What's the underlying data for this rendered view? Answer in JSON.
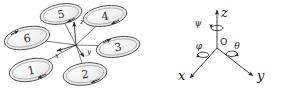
{
  "figure": {
    "background": "#ffffff",
    "stroke": "#3a3a3a",
    "rotor_fill": "#f0f0f0"
  },
  "hexacopter": {
    "name": "hexacopter-schematic",
    "rotors": [
      {
        "id": "1",
        "label": "1",
        "cx": 31,
        "cy": 70,
        "rx": 22,
        "ry": 11,
        "rot": -12,
        "spin": "cw"
      },
      {
        "id": "2",
        "label": "2",
        "cx": 85,
        "cy": 74,
        "rx": 22,
        "ry": 11,
        "rot": -8,
        "spin": "ccw"
      },
      {
        "id": "3",
        "label": "3",
        "cx": 118,
        "cy": 47,
        "rx": 22,
        "ry": 10,
        "rot": -10,
        "spin": "cw"
      },
      {
        "id": "4",
        "label": "4",
        "cx": 105,
        "cy": 16,
        "rx": 22,
        "ry": 10,
        "rot": -10,
        "spin": "ccw"
      },
      {
        "id": "5",
        "label": "5",
        "cx": 61,
        "cy": 14,
        "rx": 21,
        "ry": 10,
        "rot": -10,
        "spin": "cw"
      },
      {
        "id": "6",
        "label": "6",
        "cx": 27,
        "cy": 38,
        "rx": 23,
        "ry": 11,
        "rot": -12,
        "spin": "ccw"
      }
    ],
    "hub": {
      "x": 76,
      "y": 45
    },
    "body_axes": [
      {
        "axis": "z",
        "label": "z",
        "lx": 80,
        "ly": 22
      },
      {
        "axis": "x",
        "label": "x",
        "lx": 57,
        "ly": 56
      },
      {
        "axis": "y",
        "label": "y",
        "lx": 87,
        "ly": 52
      }
    ]
  },
  "frame": {
    "name": "euler-coordinate-frame",
    "origin_label": "O",
    "axes": [
      {
        "axis": "z",
        "label": "z",
        "lx": 222,
        "ly": 15
      },
      {
        "axis": "x",
        "label": "x",
        "lx": 183,
        "ly": 79
      },
      {
        "axis": "y",
        "label": "y",
        "lx": 261,
        "ly": 79
      }
    ],
    "angles": [
      {
        "symbol": "ψ",
        "about": "z",
        "lx": 201,
        "ly": 23
      },
      {
        "symbol": "φ",
        "about": "x",
        "lx": 198,
        "ly": 52
      },
      {
        "symbol": "θ",
        "about": "y",
        "lx": 238,
        "ly": 52
      }
    ]
  }
}
